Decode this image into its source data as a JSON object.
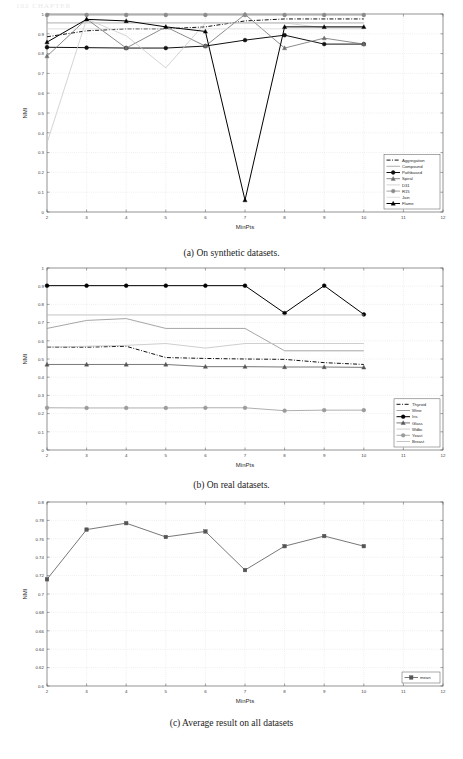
{
  "page_header": "102     CHAPTER",
  "figure": {
    "panels": [
      {
        "id": "a",
        "caption": "(a) On synthetic datasets.",
        "chart_data": {
          "type": "line",
          "title": "",
          "xlabel": "MinPts",
          "ylabel": "NMI",
          "x": [
            2,
            3,
            4,
            5,
            6,
            7,
            8,
            9,
            10
          ],
          "xlim": [
            2,
            12
          ],
          "ylim": [
            0,
            1
          ],
          "xticks": [
            2,
            3,
            4,
            5,
            6,
            7,
            8,
            9,
            10,
            11,
            12
          ],
          "yticks": [
            0,
            0.1,
            0.2,
            0.3,
            0.4,
            0.5,
            0.6,
            0.7,
            0.8,
            0.9,
            1
          ],
          "grid": true,
          "legend_position": "lower right",
          "series": [
            {
              "name": "Aggregation",
              "color": "#111111",
              "style": "dashdot",
              "marker": "none",
              "values": [
                0.885,
                0.915,
                0.925,
                0.925,
                0.935,
                0.965,
                0.975,
                0.975,
                0.975
              ]
            },
            {
              "name": "Compound",
              "color": "#9a9a9a",
              "style": "solid",
              "marker": "none",
              "values": [
                0.955,
                0.955,
                0.955,
                0.955,
                0.955,
                0.955,
                0.955,
                0.955,
                0.955
              ]
            },
            {
              "name": "Pathbased",
              "color": "#111111",
              "style": "solid",
              "marker": "circle",
              "values": [
                0.832,
                0.83,
                0.828,
                0.828,
                0.838,
                0.868,
                0.893,
                0.848,
                0.848
              ]
            },
            {
              "name": "Spiral",
              "color": "#6e6e6e",
              "style": "solid",
              "marker": "triangle",
              "values": [
                0.787,
                0.975,
                0.828,
                0.935,
                0.838,
                0.998,
                0.828,
                0.878,
                0.848
              ]
            },
            {
              "name": "D31",
              "color": "#c9c9c9",
              "style": "solid",
              "marker": "none",
              "values": [
                0.348,
                0.975,
                0.89,
                0.728,
                0.955,
                0.955,
                0.955,
                0.93,
                0.93
              ]
            },
            {
              "name": "R15",
              "color": "#8a8a8a",
              "style": "solid",
              "marker": "circle",
              "values": [
                0.995,
                0.995,
                0.995,
                0.995,
                0.995,
                0.995,
                0.995,
                0.995,
                0.995
              ]
            },
            {
              "name": "Jain",
              "color": "#d8d8d8",
              "style": "solid",
              "marker": "none",
              "values": [
                0.925,
                0.925,
                0.925,
                0.925,
                0.925,
                0.925,
                0.925,
                0.925,
                0.925
              ]
            },
            {
              "name": "Flame",
              "color": "#000000",
              "style": "solid",
              "marker": "triangle",
              "values": [
                0.858,
                0.973,
                0.965,
                0.935,
                0.912,
                0.06,
                0.935,
                0.935,
                0.935
              ]
            }
          ]
        }
      },
      {
        "id": "b",
        "caption": "(b) On real datasets.",
        "chart_data": {
          "type": "line",
          "title": "",
          "xlabel": "MinPts",
          "ylabel": "NMI",
          "x": [
            2,
            3,
            4,
            5,
            6,
            7,
            8,
            9,
            10
          ],
          "xlim": [
            2,
            12
          ],
          "ylim": [
            0,
            1
          ],
          "xticks": [
            2,
            3,
            4,
            5,
            6,
            7,
            8,
            9,
            10,
            11,
            12
          ],
          "yticks": [
            0,
            0.1,
            0.2,
            0.3,
            0.4,
            0.5,
            0.6,
            0.7,
            0.8,
            0.9,
            1
          ],
          "grid": true,
          "legend_position": "lower right",
          "series": [
            {
              "name": "Thyroid",
              "color": "#111111",
              "style": "dashdot",
              "marker": "none",
              "values": [
                0.565,
                0.565,
                0.57,
                0.508,
                0.503,
                0.5,
                0.498,
                0.48,
                0.47
              ]
            },
            {
              "name": "Wine",
              "color": "#8f8f8f",
              "style": "solid",
              "marker": "none",
              "values": [
                0.668,
                0.712,
                0.722,
                0.668,
                0.668,
                0.668,
                0.545,
                0.545,
                0.545
              ]
            },
            {
              "name": "Iris",
              "color": "#000000",
              "style": "solid",
              "marker": "circle",
              "values": [
                0.903,
                0.903,
                0.903,
                0.903,
                0.903,
                0.903,
                0.752,
                0.903,
                0.745
              ]
            },
            {
              "name": "Glass",
              "color": "#555555",
              "style": "solid",
              "marker": "triangle",
              "values": [
                0.47,
                0.47,
                0.47,
                0.47,
                0.458,
                0.458,
                0.456,
                0.456,
                0.454
              ]
            },
            {
              "name": "Wdbc",
              "color": "#c2c2c2",
              "style": "solid",
              "marker": "none",
              "values": [
                0.565,
                0.57,
                0.575,
                0.585,
                0.56,
                0.585,
                0.585,
                0.585,
                0.585
              ]
            },
            {
              "name": "Yeast",
              "color": "#9a9a9a",
              "style": "solid",
              "marker": "circle",
              "values": [
                0.232,
                0.231,
                0.231,
                0.231,
                0.232,
                0.232,
                0.216,
                0.219,
                0.219
              ]
            },
            {
              "name": "Breast",
              "color": "#b5b5b5",
              "style": "solid",
              "marker": "none",
              "values": [
                0.742,
                0.742,
                0.742,
                0.742,
                0.742,
                0.742,
                0.742,
                0.742,
                0.742
              ]
            }
          ]
        }
      },
      {
        "id": "c",
        "caption": "(c) Average result on all datasets",
        "chart_data": {
          "type": "line",
          "title": "",
          "xlabel": "MinPts",
          "ylabel": "NMI",
          "x": [
            2,
            3,
            4,
            5,
            6,
            7,
            8,
            9,
            10
          ],
          "xlim": [
            2,
            12
          ],
          "ylim": [
            0.6,
            0.8
          ],
          "xticks": [
            2,
            3,
            4,
            5,
            6,
            7,
            8,
            9,
            10,
            11,
            12
          ],
          "yticks": [
            0.6,
            0.62,
            0.64,
            0.66,
            0.68,
            0.7,
            0.72,
            0.74,
            0.76,
            0.78,
            0.8
          ],
          "grid": true,
          "legend_position": "lower right",
          "series": [
            {
              "name": "mean",
              "color": "#555555",
              "style": "solid",
              "marker": "square",
              "values": [
                0.716,
                0.77,
                0.777,
                0.762,
                0.768,
                0.726,
                0.752,
                0.763,
                0.752
              ]
            }
          ]
        }
      }
    ]
  }
}
